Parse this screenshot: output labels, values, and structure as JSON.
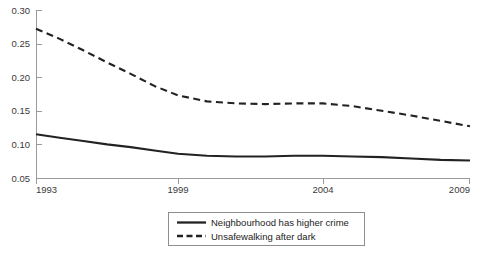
{
  "chart_data": {
    "type": "line",
    "title": "",
    "subtitle": "",
    "xlabel": "",
    "ylabel": "",
    "x": [
      1993,
      1994,
      1995,
      1996,
      1997,
      1998,
      1999,
      2000,
      2001,
      2002,
      2003,
      2004,
      2005,
      2006,
      2007,
      2008,
      2009
    ],
    "xticks": [
      "1993",
      "1999",
      "2004",
      "2009"
    ],
    "xtick_values": [
      1993,
      1999,
      2004,
      2009
    ],
    "yticks": [
      "0.05",
      "0.10",
      "0.15",
      "0.20",
      "0.25",
      "0.30"
    ],
    "ytick_values": [
      0.05,
      0.1,
      0.15,
      0.2,
      0.25,
      0.3
    ],
    "ylim": [
      0.05,
      0.3
    ],
    "xlim": [
      1993,
      2009
    ],
    "grid": false,
    "legend_position": "bottom-center",
    "series": [
      {
        "name": "Neighbourhood has higher crime",
        "style": "solid",
        "color": "#222222",
        "values": [
          0.115,
          0.11,
          0.105,
          0.1,
          0.096,
          0.091,
          0.086,
          0.083,
          0.082,
          0.082,
          0.083,
          0.083,
          0.082,
          0.081,
          0.079,
          0.077,
          0.076
        ]
      },
      {
        "name": "Unsafewalking after dark",
        "style": "dashed",
        "color": "#222222",
        "values": [
          0.272,
          0.257,
          0.24,
          0.222,
          0.205,
          0.187,
          0.173,
          0.164,
          0.161,
          0.16,
          0.161,
          0.161,
          0.157,
          0.15,
          0.143,
          0.135,
          0.127
        ]
      }
    ]
  },
  "legend": {
    "items": [
      {
        "label": "Neighbourhood has higher crime",
        "style": "solid"
      },
      {
        "label": "Unsafewalking after dark",
        "style": "dashed"
      }
    ]
  },
  "axis": {
    "y_tick_labels": [
      "0.30",
      "0.25",
      "0.20",
      "0.15",
      "0.10",
      "0.05"
    ],
    "x_tick_labels": [
      "1993",
      "1999",
      "2004",
      "2009"
    ]
  }
}
